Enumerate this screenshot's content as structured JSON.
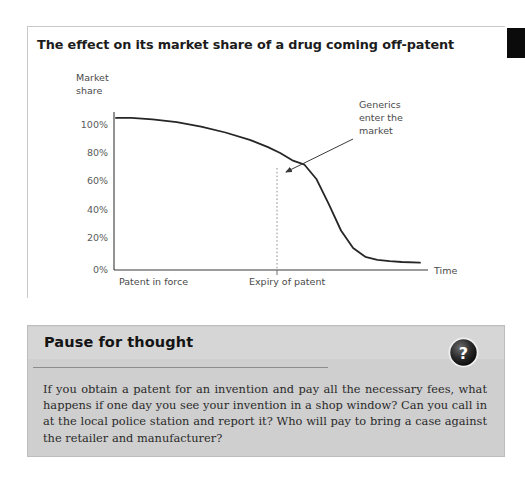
{
  "figure": {
    "title": "The effect on its market share of a drug coming off-patent"
  },
  "page_tab": {
    "name": "chapter-thumb-tab"
  },
  "chart_data": {
    "type": "line",
    "title": "The effect on its market share of a drug coming off-patent",
    "ylabel_line1": "Market",
    "ylabel_line2": "share",
    "xlabel": "Time",
    "ytick_labels": [
      "0%",
      "20%",
      "40%",
      "60%",
      "80%",
      "100%"
    ],
    "ytick_values": [
      0,
      20,
      40,
      60,
      80,
      100
    ],
    "ylim": [
      0,
      108
    ],
    "xtick_labels": [
      "Patent in force",
      "Expiry of patent"
    ],
    "grid": false,
    "legend": false,
    "annotations": [
      {
        "name": "generics-enter-the-market",
        "lines": [
          "Generics",
          "enter the",
          "market"
        ],
        "points_to_x": 276,
        "points_to_y": 72
      },
      {
        "name": "expiry-marker",
        "style": "dotted-vertical",
        "at_x_label": "Expiry of patent",
        "value_at_marker": 72
      }
    ],
    "series": [
      {
        "name": "Market share of originator drug",
        "x": [
          0,
          5,
          12,
          20,
          28,
          36,
          44,
          50,
          54,
          58,
          62,
          66,
          70,
          74,
          78,
          82,
          86,
          90,
          94,
          100
        ],
        "y": [
          104,
          104,
          103,
          101,
          98,
          94,
          89,
          84,
          80,
          75,
          72,
          62,
          45,
          27,
          15,
          9,
          7,
          6,
          5.5,
          5
        ]
      }
    ],
    "axis_color": "#3a3a3a",
    "curve_color": "#262626"
  },
  "pause": {
    "heading": "Pause for thought",
    "badge_glyph": "?",
    "body": "If you obtain a patent for an invention and pay all the necessary fees, what happens if one day you see your invention in a shop window? Can you call in at the local police station and report it? Who will pay to bring a case against the retailer and manufacturer?"
  },
  "colors": {
    "panel_bg": "#cfcfcf",
    "panel_head": "#d6d6d6",
    "tab_black": "#0b0b0b",
    "ink": "#1c1c1c"
  }
}
